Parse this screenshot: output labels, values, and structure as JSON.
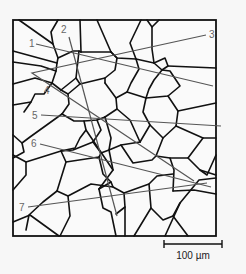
{
  "figure": {
    "frame": {
      "x": 13,
      "y": 20,
      "width": 203,
      "height": 216
    },
    "colors": {
      "grain_boundary": "#111111",
      "test_line": "#555555",
      "label": "#666666",
      "background": "#fafafa"
    },
    "test_lines": [
      {
        "label": "1",
        "x1": 36,
        "y1": 44,
        "x2": 213,
        "y2": 86,
        "lx": 29,
        "ly": 47
      },
      {
        "label": "2",
        "x1": 69,
        "y1": 37,
        "x2": 117,
        "y2": 216,
        "lx": 61,
        "ly": 33
      },
      {
        "label": "3",
        "x1": 32,
        "y1": 73,
        "x2": 206,
        "y2": 35,
        "lx": 209,
        "ly": 38
      },
      {
        "label": "4",
        "x1": 32,
        "y1": 73,
        "x2": 194,
        "y2": 181,
        "lx": 44,
        "ly": 94
      },
      {
        "label": "5",
        "x1": 41,
        "y1": 115,
        "x2": 221,
        "y2": 126,
        "lx": 32,
        "ly": 119
      },
      {
        "label": "6",
        "x1": 40,
        "y1": 144,
        "x2": 211,
        "y2": 187,
        "lx": 31,
        "ly": 147
      },
      {
        "label": "7",
        "x1": 28,
        "y1": 207,
        "x2": 207,
        "y2": 183,
        "lx": 19,
        "ly": 211
      }
    ],
    "scale_bar": {
      "x1": 164,
      "x2": 222,
      "y": 244,
      "label": "100 µm"
    }
  }
}
